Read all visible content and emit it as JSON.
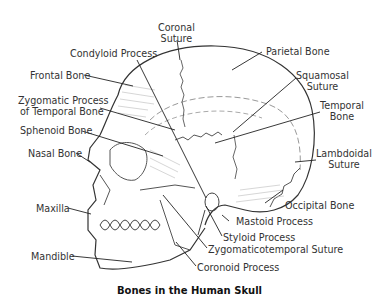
{
  "title": "Bones in the Human Skull",
  "labels": {
    "coronal_suture": [
      "Coronal",
      "Suture"
    ],
    "condyloid_process": "Condyloid Process",
    "parietal_bone": "Parietal Bone",
    "frontal_bone": "Frontal Bone",
    "squamosal_suture": [
      "Squamosal",
      "Suture"
    ],
    "zygomatic_process": [
      "Zygomatic Process",
      "of Temporal Bone"
    ],
    "temporal_bone": [
      "Temporal",
      "Bone"
    ],
    "sphenoid_bone": "Sphenoid Bone",
    "nasal_bone": "Nasal Bone",
    "lambdoidal_suture": [
      "Lambdoidal",
      "Suture"
    ],
    "occipital_bone": "Occipital Bone",
    "maxilla": "Maxilla",
    "mastoid_process": "Mastoid Process",
    "styloid_process": "Styloid Process",
    "zygomaticotemporal_suture": "Zygomaticotemporal Suture",
    "mandible": "Mandible",
    "coronoid_process": "Coronoid Process"
  }
}
